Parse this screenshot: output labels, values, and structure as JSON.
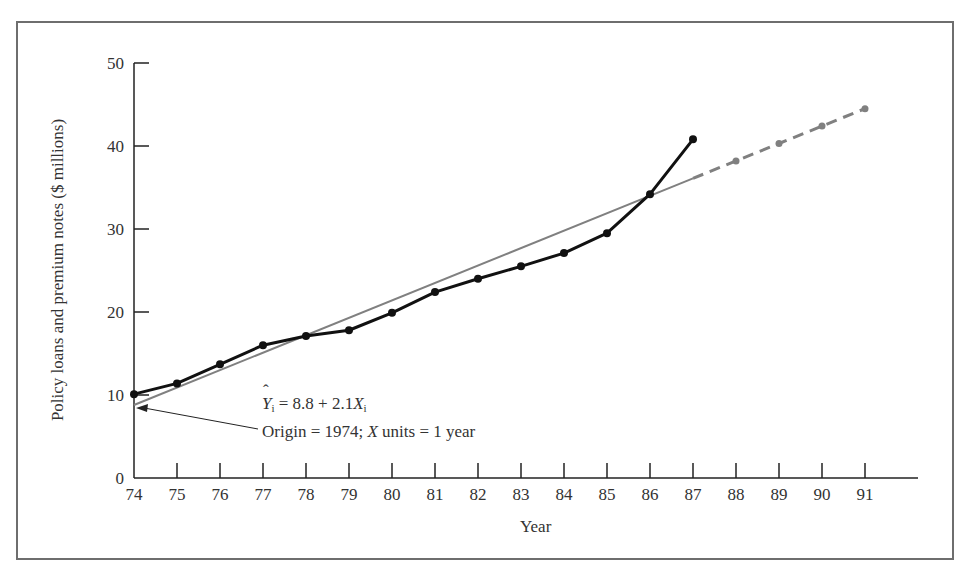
{
  "chart_data": {
    "type": "line",
    "title": "",
    "xlabel": "Year",
    "ylabel": "Policy loans and premium notes ($ millions)",
    "xlim": [
      74,
      92
    ],
    "ylim": [
      0,
      50
    ],
    "x_ticks": [
      "74",
      "75",
      "76",
      "77",
      "78",
      "79",
      "80",
      "81",
      "82",
      "83",
      "84",
      "85",
      "86",
      "87",
      "88",
      "89",
      "90",
      "91"
    ],
    "y_ticks": [
      "0",
      "10",
      "20",
      "30",
      "40",
      "50"
    ],
    "grid": false,
    "series": [
      {
        "name": "Actual",
        "style": "solid black with markers",
        "x": [
          74,
          75,
          76,
          77,
          78,
          79,
          80,
          81,
          82,
          83,
          84,
          85,
          86,
          87
        ],
        "values": [
          10.1,
          11.4,
          13.7,
          16.0,
          17.1,
          17.8,
          19.9,
          22.4,
          24.0,
          25.5,
          27.1,
          29.5,
          34.2,
          40.8
        ]
      },
      {
        "name": "Trend (fitted)",
        "style": "solid gray line",
        "x": [
          74,
          87
        ],
        "values": [
          8.8,
          36.1
        ]
      },
      {
        "name": "Trend forecast",
        "style": "dashed gray with markers",
        "x": [
          87,
          88,
          89,
          90,
          91
        ],
        "values": [
          36.1,
          38.2,
          40.3,
          42.4,
          44.5
        ]
      }
    ],
    "annotations": [
      {
        "text": "Ŷi = 8.8 + 2.1Xi",
        "arrow_to": [
          74,
          8.8
        ]
      },
      {
        "text": "Origin = 1974; X units = 1 year"
      }
    ]
  },
  "labels": {
    "xlabel": "Year",
    "ylabel": "Policy loans and premium notes ($ millions)",
    "eq_y": "Y",
    "eq_sub": "i",
    "eq_mid": " = 8.8 + 2.1",
    "eq_x": "X",
    "eq_sub2": "i",
    "origin_pre": "Origin = 1974; ",
    "origin_x": "X",
    "origin_post": " units = 1 year"
  },
  "colors": {
    "actual": "#111111",
    "trend": "#808080",
    "axis": "#222222",
    "frame": "#6e6e6e"
  }
}
